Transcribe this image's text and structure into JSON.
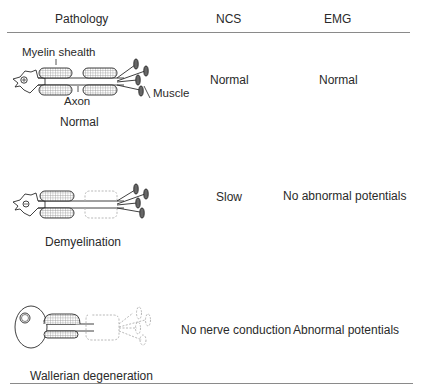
{
  "table": {
    "headers": {
      "pathology": "Pathology",
      "ncs": "NCS",
      "emg": "EMG"
    },
    "rows": [
      {
        "pathology": "Normal",
        "ncs": "Normal",
        "emg": "Normal",
        "labels": {
          "myelin": "Myelin shealth",
          "axon": "Axon",
          "muscle": "Muscle"
        }
      },
      {
        "pathology": "Demyelination",
        "ncs": "Slow",
        "emg": "No abnormal potentials"
      },
      {
        "pathology": "Wallerian degeneration",
        "ncs": "No nerve conduction",
        "emg": "Abnormal potentials"
      }
    ]
  },
  "colors": {
    "line": "#2a2a2a",
    "rule": "#8a8a8a",
    "hatch": "#9a9a9a",
    "dashed": "#b0b0b0"
  }
}
